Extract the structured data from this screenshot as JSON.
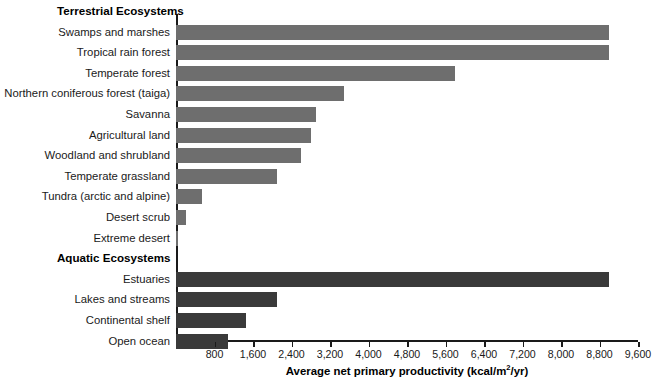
{
  "chart_data": {
    "type": "bar",
    "orientation": "horizontal",
    "title": "",
    "xlabel": "Average net primary productivity (kcal/m2/yr)",
    "ylabel": "",
    "xlim": [
      0,
      9600
    ],
    "xticks": [
      800,
      1600,
      2400,
      3200,
      4000,
      4800,
      5600,
      6400,
      7200,
      8000,
      8800,
      9600
    ],
    "xtick_labels": [
      "800",
      "1,600",
      "2,400",
      "3,200",
      "4,000",
      "4,800",
      "5,600",
      "6,400",
      "7,200",
      "8,000",
      "8,800",
      "9,600"
    ],
    "grid": false,
    "legend": false,
    "groups": [
      {
        "name": "Terrestrial Ecosystems",
        "color": "#6e6e6e",
        "categories": [
          "Swamps and marshes",
          "Tropical rain forest",
          "Temperate forest",
          "Northern coniferous forest (taiga)",
          "Savanna",
          "Agricultural land",
          "Woodland and shrubland",
          "Temperate grassland",
          "Tundra (arctic and alpine)",
          "Desert scrub",
          "Extreme desert"
        ],
        "values": [
          9000,
          9000,
          5800,
          3500,
          2900,
          2800,
          2600,
          2100,
          540,
          200,
          45
        ]
      },
      {
        "name": "Aquatic Ecosystems",
        "color": "#3a3a3a",
        "categories": [
          "Estuaries",
          "Lakes and streams",
          "Continental shelf",
          "Open ocean"
        ],
        "values": [
          9000,
          2100,
          1450,
          1080
        ]
      }
    ]
  },
  "axis": {
    "x_title_prefix": "Average net primary productivity (kcal/m",
    "x_title_sup": "2",
    "x_title_suffix": "/yr)"
  }
}
